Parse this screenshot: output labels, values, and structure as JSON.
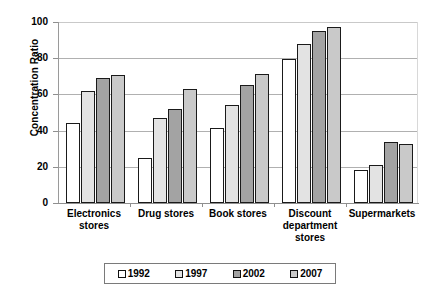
{
  "chart_data": {
    "type": "bar",
    "title": "",
    "xlabel": "",
    "ylabel": "Concentration Ratio",
    "ylim": [
      0,
      100
    ],
    "ytick_labels": [
      "0",
      "20",
      "40",
      "60",
      "80",
      "100"
    ],
    "yticks": [
      0,
      20,
      40,
      60,
      80,
      100
    ],
    "grid": true,
    "legend_position": "bottom",
    "categories": [
      "Electronics stores",
      "Drug stores",
      "Book stores",
      "Discount department stores",
      "Supermarkets"
    ],
    "category_lines": [
      [
        "Electronics",
        "stores"
      ],
      [
        "Drug stores"
      ],
      [
        "Book stores"
      ],
      [
        "Discount",
        "department",
        "stores"
      ],
      [
        "Supermarkets"
      ]
    ],
    "series": [
      {
        "name": "1992",
        "color": "#ffffff",
        "values": [
          44,
          25,
          41.5,
          79.5,
          18.5
        ]
      },
      {
        "name": "1997",
        "color": "#e3e3e3",
        "values": [
          62,
          47,
          54,
          88,
          21
        ]
      },
      {
        "name": "2002",
        "color": "#a3a3a3",
        "values": [
          69,
          52,
          65,
          95,
          33.5
        ]
      },
      {
        "name": "2007",
        "color": "#c9c9c9",
        "values": [
          70.5,
          63,
          71.5,
          97,
          32.5
        ]
      }
    ]
  },
  "legend": {
    "items": [
      {
        "label": "1992",
        "color": "#ffffff"
      },
      {
        "label": "1997",
        "color": "#e3e3e3"
      },
      {
        "label": "2002",
        "color": "#a3a3a3"
      },
      {
        "label": "2007",
        "color": "#c9c9c9"
      }
    ]
  }
}
